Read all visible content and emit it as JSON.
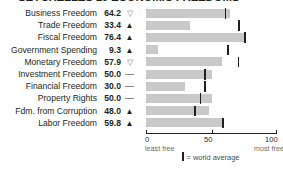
{
  "title": "SEYCHELLES  10 ECONOMIC FREEDOMS",
  "chart_data": {
    "type": "bar",
    "title": "SEYCHELLES  10 ECONOMIC FREEDOMS",
    "xlabel": "",
    "ylabel": "",
    "xlim": [
      0,
      100
    ],
    "ticks": [
      "0",
      "50",
      "100"
    ],
    "tick_sublabels": {
      "left": "least free",
      "right": "most free"
    },
    "grid": false,
    "legend": "= world average",
    "bar_color": "#c9c9c9",
    "marker_color": "#231f20",
    "categories": [
      "Business Freedom",
      "Trade Freedom",
      "Fiscal Freedom",
      "Government Spending",
      "Monetary Freedom",
      "Investment Freedom",
      "Financial Freedom",
      "Property Rights",
      "Fdm. from Corruption",
      "Labor Freedom"
    ],
    "values": [
      64.2,
      33.4,
      76.4,
      9.3,
      57.9,
      50.0,
      30.0,
      50.0,
      48.0,
      59.8
    ],
    "value_labels": [
      "64.2",
      "33.4",
      "76.4",
      "9.3",
      "57.9",
      "50.0",
      "30.0",
      "50.0",
      "48.0",
      "59.8"
    ],
    "trends": [
      "down",
      "up",
      "up",
      "up",
      "down",
      "flat",
      "flat",
      "flat",
      "up",
      "up"
    ],
    "trend_glyphs": [
      "▽",
      "▲",
      "▲",
      "▲",
      "▽",
      "—",
      "—",
      "—",
      "▲",
      "▲"
    ],
    "world_average": [
      60.2,
      70.3,
      75.0,
      62.0,
      70.0,
      44.5,
      44.5,
      41.0,
      37.0,
      58.0
    ]
  },
  "rows": [
    {
      "label": "Business Freedom",
      "value": "64.2",
      "trend": "▽",
      "trend_dir": "down",
      "bar": 64.2,
      "avg": 60.2
    },
    {
      "label": "Trade Freedom",
      "value": "33.4",
      "trend": "▲",
      "trend_dir": "up",
      "bar": 33.4,
      "avg": 70.3
    },
    {
      "label": "Fiscal Freedom",
      "value": "76.4",
      "trend": "▲",
      "trend_dir": "up",
      "bar": 76.4,
      "avg": 75.0
    },
    {
      "label": "Government Spending",
      "value": "9.3",
      "trend": "▲",
      "trend_dir": "up",
      "bar": 9.3,
      "avg": 62.0
    },
    {
      "label": "Monetary Freedom",
      "value": "57.9",
      "trend": "▽",
      "trend_dir": "down",
      "bar": 57.9,
      "avg": 70.0
    },
    {
      "label": "Investment Freedom",
      "value": "50.0",
      "trend": "—",
      "trend_dir": "flat",
      "bar": 50.0,
      "avg": 44.5
    },
    {
      "label": "Financial Freedom",
      "value": "30.0",
      "trend": "—",
      "trend_dir": "flat",
      "bar": 30.0,
      "avg": 44.5
    },
    {
      "label": "Property Rights",
      "value": "50.0",
      "trend": "—",
      "trend_dir": "flat",
      "bar": 50.0,
      "avg": 41.0
    },
    {
      "label": "Fdm. from Corruption",
      "value": "48.0",
      "trend": "▲",
      "trend_dir": "up",
      "bar": 48.0,
      "avg": 37.0
    },
    {
      "label": "Labor Freedom",
      "value": "59.8",
      "trend": "▲",
      "trend_dir": "up",
      "bar": 59.8,
      "avg": 58.0
    }
  ],
  "axis": {
    "t0": "0",
    "t50": "50",
    "t100": "100",
    "least_free": "least free",
    "most_free": "most free"
  },
  "legend": {
    "text": "= world average"
  }
}
